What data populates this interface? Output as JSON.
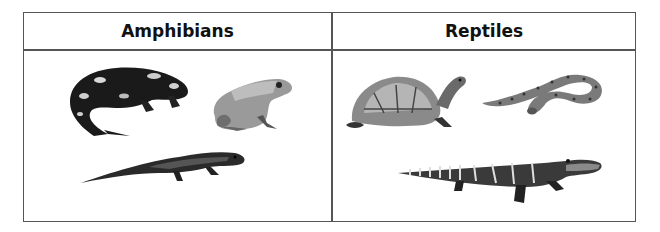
{
  "table": {
    "columns": [
      {
        "header": "Amphibians",
        "images": [
          {
            "name": "fire-salamander",
            "description": "spotted salamander curled"
          },
          {
            "name": "frog",
            "description": "frog sitting"
          },
          {
            "name": "newt",
            "description": "long newt/salamander walking"
          }
        ]
      },
      {
        "header": "Reptiles",
        "images": [
          {
            "name": "turtle",
            "description": "box turtle"
          },
          {
            "name": "snake",
            "description": "coiled snake"
          },
          {
            "name": "alligator",
            "description": "young alligator"
          }
        ]
      }
    ]
  },
  "colors": {
    "border": "#555555",
    "text": "#111111",
    "background": "#ffffff"
  }
}
